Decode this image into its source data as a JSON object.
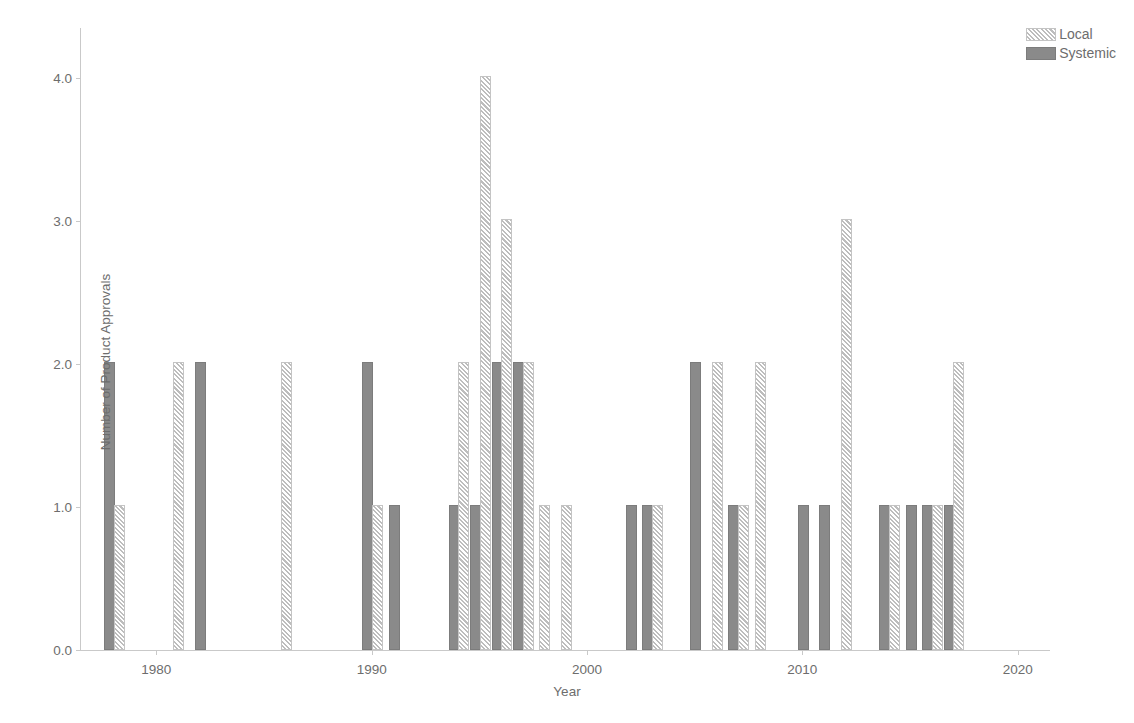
{
  "chart_data": {
    "type": "bar",
    "title": "",
    "xlabel": "Year",
    "ylabel": "Number of Product Approvals",
    "xlim": [
      1976.5,
      2021.5
    ],
    "ylim": [
      0.0,
      4.35
    ],
    "xticks": [
      1980,
      1990,
      2000,
      2010,
      2020
    ],
    "xticklabels": [
      "1980",
      "1990",
      "2000",
      "2010",
      "2020"
    ],
    "yticks": [
      0.0,
      1.0,
      2.0,
      3.0,
      4.0
    ],
    "yticklabels": [
      "0.0",
      "1.0",
      "2.0",
      "3.0",
      "4.0"
    ],
    "grid": false,
    "legend_position": "top-right",
    "series": [
      {
        "name": "Local",
        "fill": "hatched",
        "color": "#bdbdbd",
        "points": [
          {
            "year": 1978,
            "value": 1
          },
          {
            "year": 1981,
            "value": 2
          },
          {
            "year": 1986,
            "value": 2
          },
          {
            "year": 1990,
            "value": 1
          },
          {
            "year": 1994,
            "value": 2
          },
          {
            "year": 1995,
            "value": 4
          },
          {
            "year": 1996,
            "value": 3
          },
          {
            "year": 1997,
            "value": 2
          },
          {
            "year": 1998,
            "value": 1
          },
          {
            "year": 1999,
            "value": 1
          },
          {
            "year": 2003,
            "value": 1
          },
          {
            "year": 2006,
            "value": 2
          },
          {
            "year": 2007,
            "value": 1
          },
          {
            "year": 2008,
            "value": 2
          },
          {
            "year": 2012,
            "value": 3
          },
          {
            "year": 2014,
            "value": 1
          },
          {
            "year": 2016,
            "value": 1
          },
          {
            "year": 2017,
            "value": 2
          }
        ]
      },
      {
        "name": "Systemic",
        "fill": "solid",
        "color": "#8a8a8a",
        "points": [
          {
            "year": 1978,
            "value": 2
          },
          {
            "year": 1982,
            "value": 2
          },
          {
            "year": 1990,
            "value": 2
          },
          {
            "year": 1991,
            "value": 1
          },
          {
            "year": 1994,
            "value": 1
          },
          {
            "year": 1995,
            "value": 1
          },
          {
            "year": 1996,
            "value": 2
          },
          {
            "year": 1997,
            "value": 2
          },
          {
            "year": 2002,
            "value": 1
          },
          {
            "year": 2003,
            "value": 1
          },
          {
            "year": 2005,
            "value": 2
          },
          {
            "year": 2007,
            "value": 1
          },
          {
            "year": 2010,
            "value": 1
          },
          {
            "year": 2011,
            "value": 1
          },
          {
            "year": 2014,
            "value": 1
          },
          {
            "year": 2015,
            "value": 1
          },
          {
            "year": 2016,
            "value": 1
          },
          {
            "year": 2017,
            "value": 1
          }
        ]
      }
    ],
    "legend": [
      {
        "label": "Local",
        "fill": "hatched"
      },
      {
        "label": "Systemic",
        "fill": "solid"
      }
    ]
  }
}
